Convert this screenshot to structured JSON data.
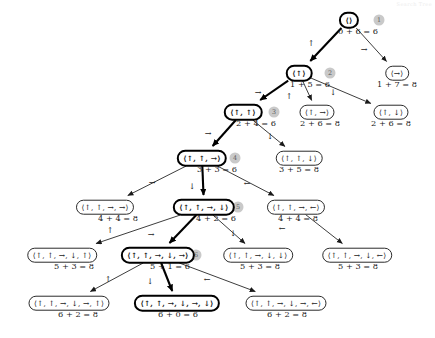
{
  "figure": {
    "corner_note": "Search Tree"
  },
  "colors": {
    "node_border": "#2b2b2b",
    "path_border": "#000000",
    "badge_fill": "#c9c9c9",
    "badge_text": "#5a5a5a",
    "edge": "#1a1a1a",
    "background": "#ffffff"
  },
  "nodes": [
    {
      "id": "n0",
      "label": "⟨⟩",
      "cost": "0 + 6 = 6",
      "x": 349,
      "y": 20,
      "cost_x": 358,
      "cost_y": 26,
      "on_path": true
    },
    {
      "id": "n1",
      "label": "⟨↑⟩",
      "cost": "1 + 5 = 6",
      "x": 299,
      "y": 73,
      "cost_x": 310,
      "cost_y": 79,
      "on_path": true
    },
    {
      "id": "n2",
      "label": "⟨→⟩",
      "cost": "1 + 7 = 8",
      "x": 397,
      "y": 73,
      "cost_x": 397,
      "cost_y": 79,
      "on_path": false
    },
    {
      "id": "n3",
      "label": "⟨↑, ↑⟩",
      "cost": "2 + 4 = 6",
      "x": 243,
      "y": 112,
      "cost_x": 256,
      "cost_y": 118,
      "on_path": true
    },
    {
      "id": "n4",
      "label": "⟨↑, →⟩",
      "cost": "2 + 6 = 8",
      "x": 317,
      "y": 112,
      "cost_x": 320,
      "cost_y": 118,
      "on_path": false
    },
    {
      "id": "n5",
      "label": "⟨↑, ↓⟩",
      "cost": "2 + 6 = 8",
      "x": 391,
      "y": 112,
      "cost_x": 391,
      "cost_y": 118,
      "on_path": false
    },
    {
      "id": "n6",
      "label": "⟨↑, ↑, →⟩",
      "cost": "3 + 3 = 6",
      "x": 202,
      "y": 158,
      "cost_x": 217,
      "cost_y": 164,
      "on_path": true
    },
    {
      "id": "n7",
      "label": "⟨↑, ↑, ↓⟩",
      "cost": "3 + 5 = 8",
      "x": 299,
      "y": 158,
      "cost_x": 299,
      "cost_y": 164,
      "on_path": false
    },
    {
      "id": "n8",
      "label": "⟨↑, ↑, →, →⟩",
      "cost": "4 + 4 = 8",
      "x": 105,
      "y": 207,
      "cost_x": 118,
      "cost_y": 213,
      "on_path": false
    },
    {
      "id": "n9",
      "label": "⟨↑, ↑, →, ↓⟩",
      "cost": "4 + 2 = 6",
      "x": 204,
      "y": 207,
      "cost_x": 216,
      "cost_y": 213,
      "on_path": true
    },
    {
      "id": "n10",
      "label": "⟨↑, ↑, →, ←⟩",
      "cost": "4 + 4 = 8",
      "x": 296,
      "y": 207,
      "cost_x": 298,
      "cost_y": 213,
      "on_path": false
    },
    {
      "id": "n11",
      "label": "⟨↑, ↑, →, ↓, ↑⟩",
      "cost": "5 + 3 = 8",
      "x": 62,
      "y": 255,
      "cost_x": 74,
      "cost_y": 261,
      "on_path": false
    },
    {
      "id": "n12",
      "label": "⟨↑, ↑, →, ↓, →⟩",
      "cost": "5 + 1 = 6",
      "x": 158,
      "y": 255,
      "cost_x": 170,
      "cost_y": 261,
      "on_path": true
    },
    {
      "id": "n13",
      "label": "⟨↑, ↑, →, ↓, ↓⟩",
      "cost": "5 + 3 = 8",
      "x": 258,
      "y": 255,
      "cost_x": 260,
      "cost_y": 261,
      "on_path": false
    },
    {
      "id": "n14",
      "label": "⟨↑, ↑, →, ↓, ←⟩",
      "cost": "5 + 3 = 8",
      "x": 357,
      "y": 255,
      "cost_x": 358,
      "cost_y": 261,
      "on_path": false
    },
    {
      "id": "n15",
      "label": "⟨↑, ↑, →, ↓, →, ↑⟩",
      "cost": "6 + 2 = 8",
      "x": 69,
      "y": 303,
      "cost_x": 78,
      "cost_y": 309,
      "on_path": false
    },
    {
      "id": "n16",
      "label": "⟨↑, ↑, →, ↓, →, ↓⟩",
      "cost": "6 + 0 = 6",
      "x": 177,
      "y": 303,
      "cost_x": 178,
      "cost_y": 309,
      "on_path": true
    },
    {
      "id": "n17",
      "label": "⟨↑, ↑, →, ↓, →, ←⟩",
      "cost": "6 + 2 = 8",
      "x": 286,
      "y": 303,
      "cost_x": 287,
      "cost_y": 309,
      "on_path": false
    }
  ],
  "badges": [
    {
      "order": "1",
      "x": 379,
      "y": 20
    },
    {
      "order": "2",
      "x": 330,
      "y": 73
    },
    {
      "order": "3",
      "x": 274,
      "y": 112
    },
    {
      "order": "4",
      "x": 235,
      "y": 158
    },
    {
      "order": "5",
      "x": 238,
      "y": 207
    },
    {
      "order": "6",
      "x": 196,
      "y": 255
    },
    {
      "order": "7",
      "x": 207,
      "y": 303
    }
  ],
  "edges": [
    {
      "from": "n0",
      "to": "n1",
      "action": "↑",
      "lx": 311,
      "ly": 43,
      "bold": true
    },
    {
      "from": "n0",
      "to": "n2",
      "action": "→",
      "lx": 364,
      "ly": 49,
      "bold": false
    },
    {
      "from": "n1",
      "to": "n3",
      "action": "→",
      "lx": 258,
      "ly": 92,
      "bold": true
    },
    {
      "from": "n1",
      "to": "n4",
      "action": "↑",
      "lx": 289,
      "ly": 96,
      "bold": false
    },
    {
      "from": "n1",
      "to": "n5",
      "action": "↓",
      "lx": 333,
      "ly": 92,
      "bold": false
    },
    {
      "from": "n3",
      "to": "n6",
      "action": "→",
      "lx": 208,
      "ly": 133,
      "bold": true
    },
    {
      "from": "n3",
      "to": "n7",
      "action": "↓",
      "lx": 270,
      "ly": 136,
      "bold": false
    },
    {
      "from": "n6",
      "to": "n8",
      "action": "→",
      "lx": 152,
      "ly": 182,
      "bold": false
    },
    {
      "from": "n6",
      "to": "n9",
      "action": "↓",
      "lx": 192,
      "ly": 186,
      "bold": true
    },
    {
      "from": "n6",
      "to": "n10",
      "action": "←",
      "lx": 247,
      "ly": 183,
      "bold": false
    },
    {
      "from": "n9",
      "to": "n11",
      "action": "↑",
      "lx": 110,
      "ly": 230,
      "bold": false
    },
    {
      "from": "n9",
      "to": "n12",
      "action": "→",
      "lx": 151,
      "ly": 234,
      "bold": true
    },
    {
      "from": "n9",
      "to": "n13",
      "action": "↓",
      "lx": 233,
      "ly": 233,
      "bold": false
    },
    {
      "from": "n10",
      "to": "n14",
      "action": "←",
      "lx": 282,
      "ly": 228,
      "bold": false
    },
    {
      "from": "n12",
      "to": "n15",
      "action": "↑",
      "lx": 108,
      "ly": 279,
      "bold": false
    },
    {
      "from": "n12",
      "to": "n16",
      "action": "↓",
      "lx": 150,
      "ly": 281,
      "bold": true
    },
    {
      "from": "n12",
      "to": "n17",
      "action": "←",
      "lx": 207,
      "ly": 279,
      "bold": false
    }
  ]
}
